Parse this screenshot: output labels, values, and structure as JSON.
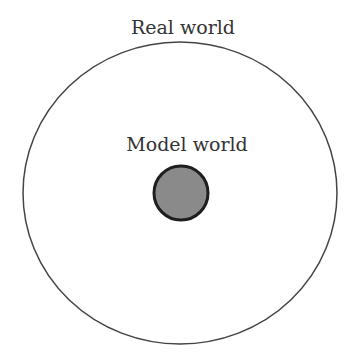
{
  "diagram": {
    "outer": {
      "label": "Real world",
      "fill": "#ffffff",
      "stroke": "#444444"
    },
    "inner": {
      "label": "Model world",
      "fill": "#8a8a8a",
      "stroke": "#222222"
    }
  }
}
